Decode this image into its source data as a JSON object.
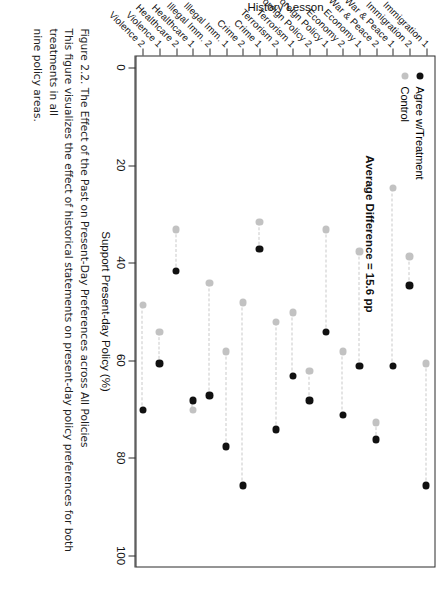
{
  "figure": {
    "number": "Figure 2.2.",
    "title": "The Effect of the Past on Present-Day Preferences across All Policies",
    "caption_lines": [
      "Figure 2.2. The Effect of the Past on Present-Day Preferences across All Policies",
      "This figure visualizes the effect of historical statements on present-day policy preferences for both treatments in all",
      "nine policy areas."
    ]
  },
  "legend": {
    "position": "top-left",
    "items": [
      {
        "label": "Agree w/Treatment",
        "color": "#111111",
        "marker": "filled-circle"
      },
      {
        "label": "Control",
        "color": "#c2c2c2",
        "marker": "filled-circle"
      }
    ]
  },
  "annotation": {
    "average_difference": "Average Difference = 15.6 pp"
  },
  "chart_data": {
    "type": "scatter",
    "subtype": "dumbbell",
    "title": "The Effect of the Past on Present-Day Preferences across All Policies",
    "xlabel": "History Lesson",
    "ylabel": "Support Present-day Policy (%)",
    "ylim": [
      0,
      100
    ],
    "yticks": [
      0,
      20,
      40,
      60,
      80,
      100
    ],
    "ytick_labels": [
      "0",
      "20",
      "40",
      "60",
      "80",
      "100"
    ],
    "grid": false,
    "legend_position": "top-left",
    "orientation": "vertical-dumbbell",
    "categories": [
      "Immigration 1",
      "Immigration 2",
      "War & Peace 1",
      "War & Peace 2",
      "Economy 1",
      "Economy 2",
      "Foreign Policy 1",
      "Foreign Policy 2",
      "Terrorism 1",
      "Terrorism 2",
      "Crime 1",
      "Crime 2",
      "Illegal Imm. 1",
      "Illegal Imm. 2",
      "Healthcare 1",
      "Healthcare 2",
      "Violence 1",
      "Violence 2"
    ],
    "series": [
      {
        "name": "Agree w/Treatment",
        "color": "#111111",
        "values": [
          85.5,
          44.5,
          61.0,
          76.0,
          61.0,
          71.0,
          54.0,
          68.0,
          63.0,
          74.0,
          37.0,
          85.5,
          77.5,
          67.0,
          68.0,
          41.5,
          60.5,
          70.0
        ]
      },
      {
        "name": "Control",
        "color": "#c2c2c2",
        "values": [
          60.5,
          38.5,
          24.5,
          72.5,
          37.5,
          58.0,
          33.0,
          62.0,
          50.0,
          52.0,
          31.5,
          48.0,
          58.0,
          44.0,
          70.0,
          33.0,
          54.0,
          48.5
        ]
      }
    ],
    "annotations": [
      {
        "text": "Average Difference = 15.6 pp",
        "value": 15.6,
        "unit": "pp"
      }
    ]
  }
}
